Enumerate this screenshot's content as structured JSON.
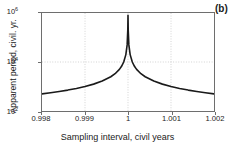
{
  "chart_data": {
    "type": "line",
    "title": "",
    "panel_label": "(b)",
    "xlabel": "Sampling interval, civil years",
    "ylabel": "Apparent period, civil. yr.",
    "xlim": [
      0.998,
      1.002
    ],
    "ylim": [
      100,
      1000000
    ],
    "yscale": "log",
    "xscale": "linear",
    "grid": true,
    "grid_style": "dotted",
    "legend": null,
    "xticks": [
      {
        "value": 0.998,
        "label": "0.998"
      },
      {
        "value": 0.999,
        "label": "0.999"
      },
      {
        "value": 1.0,
        "label": "1"
      },
      {
        "value": 1.001,
        "label": "1.001"
      },
      {
        "value": 1.002,
        "label": "1.002"
      }
    ],
    "yticks": [
      {
        "value": 100,
        "mantissa": "10",
        "exponent": "2"
      },
      {
        "value": 10000,
        "mantissa": "10",
        "exponent": "4"
      },
      {
        "value": 1000000,
        "mantissa": "10",
        "exponent": "6"
      }
    ],
    "series": [
      {
        "name": "apparent period",
        "color": "#1a1a1a",
        "width": 1.6,
        "singularity_x": 1.0,
        "peak_y": 800000,
        "description": "Hyperbolic singularity: apparent period = 1/|x-1|, diverging at sampling interval of exactly 1 civil year",
        "points": [
          {
            "x": 0.998,
            "y": 500
          },
          {
            "x": 0.9982,
            "y": 556
          },
          {
            "x": 0.9984,
            "y": 625
          },
          {
            "x": 0.9986,
            "y": 714
          },
          {
            "x": 0.9988,
            "y": 833
          },
          {
            "x": 0.999,
            "y": 1000
          },
          {
            "x": 0.9992,
            "y": 1250
          },
          {
            "x": 0.9994,
            "y": 1667
          },
          {
            "x": 0.9996,
            "y": 2500
          },
          {
            "x": 0.9997,
            "y": 3333
          },
          {
            "x": 0.9998,
            "y": 5000
          },
          {
            "x": 0.99985,
            "y": 6667
          },
          {
            "x": 0.9999,
            "y": 10000
          },
          {
            "x": 0.99995,
            "y": 20000
          },
          {
            "x": 0.99998,
            "y": 50000
          },
          {
            "x": 0.999995,
            "y": 200000
          },
          {
            "x": 1.0,
            "y": 800000
          },
          {
            "x": 1.000005,
            "y": 200000
          },
          {
            "x": 1.00002,
            "y": 50000
          },
          {
            "x": 1.00005,
            "y": 20000
          },
          {
            "x": 1.0001,
            "y": 10000
          },
          {
            "x": 1.00015,
            "y": 6667
          },
          {
            "x": 1.0002,
            "y": 5000
          },
          {
            "x": 1.0003,
            "y": 3333
          },
          {
            "x": 1.0004,
            "y": 2500
          },
          {
            "x": 1.0006,
            "y": 1667
          },
          {
            "x": 1.0008,
            "y": 1250
          },
          {
            "x": 1.001,
            "y": 1000
          },
          {
            "x": 1.0012,
            "y": 833
          },
          {
            "x": 1.0014,
            "y": 714
          },
          {
            "x": 1.0016,
            "y": 625
          },
          {
            "x": 1.0018,
            "y": 556
          },
          {
            "x": 1.002,
            "y": 500
          }
        ]
      }
    ]
  }
}
